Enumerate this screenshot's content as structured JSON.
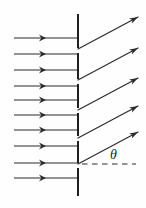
{
  "figure": {
    "canvas": {
      "width": 146,
      "height": 208
    },
    "background_color": "#fefefe",
    "ink_color": "#2b2b2b",
    "barrier_color": "#1f1f1f"
  },
  "angle_label": {
    "symbol": "θ",
    "name": "theta",
    "x": 110,
    "y": 148,
    "font_size": 14,
    "italic": true
  },
  "barrier": {
    "x": 78,
    "top": 14,
    "bottom": 196,
    "stroke_width": 2.0,
    "segments": [
      {
        "y1": 14,
        "y2": 48
      },
      {
        "y1": 53,
        "y2": 79
      },
      {
        "y1": 84,
        "y2": 108
      },
      {
        "y1": 113,
        "y2": 136
      },
      {
        "y1": 141,
        "y2": 163
      },
      {
        "y1": 168,
        "y2": 196
      }
    ]
  },
  "incoming_rays": {
    "count": 10,
    "x_start": 14,
    "x_end": 78,
    "arrow_x": 46,
    "direction": "right",
    "ys": [
      38,
      54,
      70,
      86,
      100,
      115,
      130,
      146,
      163,
      178
    ]
  },
  "outgoing_rays": {
    "count": 5,
    "angle_degrees": 28,
    "direction": "up-right",
    "paths": [
      {
        "x1": 78,
        "y1": 49,
        "x2": 138,
        "y2": 17
      },
      {
        "x1": 78,
        "y1": 80,
        "x2": 138,
        "y2": 48
      },
      {
        "x1": 78,
        "y1": 110,
        "x2": 138,
        "y2": 78
      },
      {
        "x1": 78,
        "y1": 138,
        "x2": 138,
        "y2": 106
      },
      {
        "x1": 78,
        "y1": 164,
        "x2": 138,
        "y2": 132
      }
    ]
  },
  "reference_line": {
    "type": "dashed-horizontal",
    "x1": 82,
    "x2": 136,
    "y": 164,
    "dash_pattern": "5.5 4.5"
  },
  "chart_data": {
    "type": "diagram",
    "elements": {
      "incident_rays": 10,
      "diffracted_rays": 5,
      "barrier_segments": 6,
      "angle_marked": "θ"
    }
  }
}
